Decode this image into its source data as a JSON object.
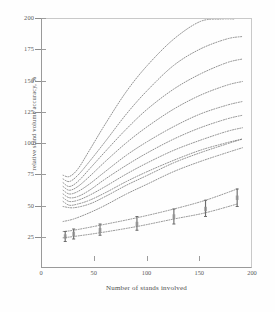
{
  "figure": {
    "background_color": "#ffffff",
    "line_color": "#6e6e6e",
    "axis_color": "#9a9a9a"
  },
  "chart_data": {
    "type": "line",
    "title": "",
    "xlabel": "Number of stands involved",
    "ylabel": "relative stand volume accuracy, %",
    "xlim": [
      0,
      200
    ],
    "ylim": [
      0,
      200
    ],
    "xticks": [
      0,
      50,
      100,
      150,
      200
    ],
    "yticks": [
      25,
      50,
      75,
      100,
      125,
      150,
      175,
      200
    ],
    "xtick_labels": [
      "0",
      "50",
      "100",
      "150",
      "200"
    ],
    "ytick_labels": [
      "25",
      "50",
      "75",
      "100",
      "125",
      "150",
      "175",
      "200"
    ],
    "grid": false,
    "legend": "none",
    "linestyle": "dotted",
    "series": [
      {
        "name": "curve-1",
        "x": [
          20,
          26,
          34,
          45,
          60,
          80,
          100,
          125,
          150,
          170,
          182
        ],
        "values": [
          75,
          74,
          80,
          95,
          116,
          142,
          163,
          184,
          198,
          200,
          200
        ]
      },
      {
        "name": "curve-2",
        "x": [
          20,
          26,
          34,
          45,
          60,
          80,
          100,
          125,
          150,
          175,
          190
        ],
        "values": [
          72,
          70,
          75,
          86,
          102,
          124,
          143,
          163,
          176,
          184,
          186
        ]
      },
      {
        "name": "curve-3",
        "x": [
          20,
          26,
          34,
          45,
          60,
          80,
          100,
          125,
          150,
          175,
          190
        ],
        "values": [
          69,
          66,
          70,
          80,
          94,
          112,
          128,
          144,
          156,
          165,
          168
        ]
      },
      {
        "name": "curve-4",
        "x": [
          20,
          26,
          34,
          45,
          60,
          80,
          100,
          125,
          150,
          175,
          190
        ],
        "values": [
          66,
          63,
          66,
          74,
          86,
          101,
          114,
          128,
          139,
          147,
          150
        ]
      },
      {
        "name": "curve-5",
        "x": [
          20,
          26,
          34,
          45,
          60,
          80,
          100,
          125,
          150,
          175,
          190
        ],
        "values": [
          63,
          60,
          62,
          68,
          78,
          91,
          102,
          114,
          124,
          131,
          134
        ]
      },
      {
        "name": "curve-6",
        "x": [
          20,
          26,
          34,
          45,
          60,
          80,
          100,
          125,
          150,
          175,
          190
        ],
        "values": [
          60,
          57,
          58,
          63,
          72,
          83,
          93,
          104,
          113,
          120,
          123
        ]
      },
      {
        "name": "curve-7",
        "x": [
          20,
          26,
          34,
          45,
          60,
          80,
          100,
          125,
          150,
          175,
          190
        ],
        "values": [
          57,
          54,
          55,
          59,
          66,
          76,
          85,
          95,
          103,
          110,
          113
        ]
      },
      {
        "name": "curve-8",
        "x": [
          20,
          26,
          34,
          45,
          60,
          80,
          100,
          125,
          150,
          175,
          190
        ],
        "values": [
          54,
          51,
          52,
          55,
          61,
          70,
          78,
          87,
          95,
          101,
          104
        ]
      },
      {
        "name": "curve-9",
        "x": [
          20,
          30,
          45,
          60,
          80,
          100,
          125,
          150,
          175,
          190
        ],
        "values": [
          50,
          49,
          52,
          58,
          67,
          75,
          85,
          93,
          100,
          104
        ]
      },
      {
        "name": "curve-10",
        "x": [
          20,
          30,
          45,
          60,
          80,
          100,
          125,
          150,
          175,
          190
        ],
        "values": [
          38,
          40,
          45,
          51,
          60,
          68,
          78,
          86,
          93,
          97
        ]
      },
      {
        "name": "curve-11",
        "x": [
          20,
          30,
          55,
          90,
          125,
          155,
          185
        ],
        "values": [
          30,
          31,
          35,
          41,
          48,
          55,
          64
        ]
      },
      {
        "name": "curve-12",
        "x": [
          20,
          30,
          55,
          90,
          125,
          155,
          185
        ],
        "values": [
          25,
          26,
          29,
          34,
          40,
          45,
          52
        ]
      }
    ],
    "error_markers": [
      {
        "x": 22,
        "y": 26,
        "low": 22,
        "high": 30
      },
      {
        "x": 30,
        "y": 28,
        "low": 24,
        "high": 32
      },
      {
        "x": 55,
        "y": 31,
        "low": 27,
        "high": 36
      },
      {
        "x": 90,
        "y": 36,
        "low": 31,
        "high": 42
      },
      {
        "x": 125,
        "y": 42,
        "low": 36,
        "high": 48
      },
      {
        "x": 155,
        "y": 48,
        "low": 42,
        "high": 55
      },
      {
        "x": 185,
        "y": 57,
        "low": 50,
        "high": 64
      }
    ]
  }
}
